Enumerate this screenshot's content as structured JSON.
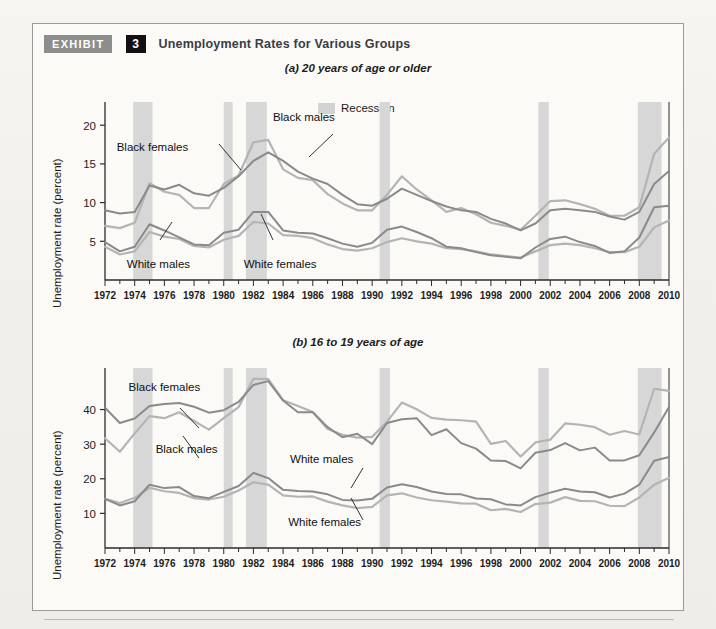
{
  "exhibit": {
    "tag": "EXHIBIT",
    "number": "3",
    "title": "Unemployment Rates for Various Groups"
  },
  "legend": {
    "recession_label": "Recession",
    "recession_color": "#d3d3d3"
  },
  "colors": {
    "black_females": "#8a8a8a",
    "black_males": "#b4b4b4",
    "white_males": "#8a8a8a",
    "white_females": "#b4b4b4",
    "axis": "#2b2b2b",
    "recession_band": "#d7d7d7"
  },
  "chart_data": [
    {
      "type": "line",
      "id": "panel-a",
      "title": "(a) 20 years of age or older",
      "xlabel": "",
      "ylabel": "Unemployment rate (percent)",
      "xlim": [
        1972,
        2010
      ],
      "ylim": [
        0,
        23
      ],
      "yticks": [
        5,
        10,
        15,
        20
      ],
      "grid": false,
      "legend_position": "top-center",
      "x": [
        1972,
        1973,
        1974,
        1975,
        1976,
        1977,
        1978,
        1979,
        1980,
        1981,
        1982,
        1983,
        1984,
        1985,
        1986,
        1987,
        1988,
        1989,
        1990,
        1991,
        1992,
        1993,
        1994,
        1995,
        1996,
        1997,
        1998,
        1999,
        2000,
        2001,
        2002,
        2003,
        2004,
        2005,
        2006,
        2007,
        2008,
        2009,
        2010
      ],
      "recession_bands": [
        [
          1973.9,
          1975.2
        ],
        [
          1980.0,
          1980.6
        ],
        [
          1981.5,
          1982.9
        ],
        [
          1990.5,
          1991.2
        ],
        [
          2001.2,
          2001.9
        ],
        [
          2007.9,
          2009.5
        ]
      ],
      "series": [
        {
          "name": "Black females",
          "values": [
            9.0,
            8.6,
            8.8,
            12.2,
            11.7,
            12.3,
            11.2,
            10.9,
            11.9,
            13.4,
            15.4,
            16.5,
            15.4,
            14.0,
            13.1,
            12.4,
            11.0,
            9.8,
            9.6,
            10.5,
            11.8,
            11.0,
            10.2,
            9.5,
            9.0,
            8.8,
            7.9,
            7.3,
            6.4,
            7.3,
            9.0,
            9.2,
            9.0,
            8.8,
            8.2,
            7.8,
            8.8,
            12.4,
            14.1
          ]
        },
        {
          "name": "Black males",
          "values": [
            7.0,
            6.7,
            7.4,
            12.5,
            11.4,
            11.0,
            9.3,
            9.3,
            12.4,
            13.5,
            17.8,
            18.1,
            14.3,
            13.2,
            12.9,
            11.1,
            9.9,
            9.0,
            9.0,
            11.0,
            13.4,
            11.7,
            10.3,
            8.8,
            9.3,
            8.5,
            7.4,
            7.0,
            6.5,
            8.3,
            10.2,
            10.3,
            9.8,
            9.2,
            8.3,
            8.3,
            9.4,
            16.3,
            18.4
          ]
        },
        {
          "name": "White males",
          "values": [
            4.9,
            3.7,
            4.3,
            7.2,
            6.4,
            5.5,
            4.6,
            4.5,
            6.1,
            6.5,
            8.8,
            8.8,
            6.4,
            6.1,
            6.0,
            5.4,
            4.7,
            4.3,
            4.8,
            6.5,
            6.9,
            6.2,
            5.4,
            4.3,
            4.1,
            3.6,
            3.2,
            3.0,
            2.8,
            4.2,
            5.3,
            5.6,
            4.9,
            4.4,
            3.5,
            3.7,
            5.5,
            9.4,
            9.6
          ]
        },
        {
          "name": "White females",
          "values": [
            4.3,
            3.3,
            3.7,
            6.2,
            5.6,
            5.3,
            4.4,
            4.2,
            5.2,
            5.7,
            7.5,
            7.3,
            5.8,
            5.7,
            5.4,
            4.6,
            4.0,
            3.8,
            4.1,
            4.9,
            5.4,
            5.0,
            4.7,
            4.1,
            4.0,
            3.7,
            3.3,
            3.1,
            2.9,
            3.7,
            4.5,
            4.7,
            4.5,
            4.1,
            3.6,
            3.6,
            4.3,
            6.8,
            7.7
          ]
        }
      ],
      "annotations": [
        {
          "text": "Black females",
          "x": 1975.2,
          "y": 16.7
        },
        {
          "text": "Black males",
          "x": 1985.4,
          "y": 20.6
        },
        {
          "text": "White males",
          "x": 1975.6,
          "y": 1.6
        },
        {
          "text": "White females",
          "x": 1983.8,
          "y": 1.6
        }
      ]
    },
    {
      "type": "line",
      "id": "panel-b",
      "title": "(b) 16 to 19 years of age",
      "xlabel": "",
      "ylabel": "Unemployment rate (percent)",
      "xlim": [
        1972,
        2010
      ],
      "ylim": [
        0,
        52
      ],
      "yticks": [
        10,
        20,
        30,
        40
      ],
      "grid": false,
      "legend_position": "none",
      "x": [
        1972,
        1973,
        1974,
        1975,
        1976,
        1977,
        1978,
        1979,
        1980,
        1981,
        1982,
        1983,
        1984,
        1985,
        1986,
        1987,
        1988,
        1989,
        1990,
        1991,
        1992,
        1993,
        1994,
        1995,
        1996,
        1997,
        1998,
        1999,
        2000,
        2001,
        2002,
        2003,
        2004,
        2005,
        2006,
        2007,
        2008,
        2009,
        2010
      ],
      "recession_bands": [
        [
          1973.9,
          1975.2
        ],
        [
          1980.0,
          1980.6
        ],
        [
          1981.5,
          1982.9
        ],
        [
          1990.5,
          1991.2
        ],
        [
          2001.2,
          2001.9
        ],
        [
          2007.9,
          2009.5
        ]
      ],
      "series": [
        {
          "name": "Black females",
          "values": [
            40.5,
            36.1,
            37.4,
            41.0,
            41.6,
            41.9,
            40.8,
            39.1,
            39.8,
            42.2,
            47.1,
            48.2,
            42.6,
            39.2,
            39.2,
            34.9,
            32.0,
            33.0,
            30.0,
            36.1,
            37.2,
            37.5,
            32.6,
            34.3,
            30.3,
            28.7,
            25.3,
            25.1,
            23.0,
            27.5,
            28.3,
            30.3,
            28.2,
            29.0,
            25.3,
            25.3,
            26.8,
            33.4,
            40.7
          ]
        },
        {
          "name": "Black males",
          "values": [
            31.7,
            27.8,
            33.1,
            38.1,
            37.5,
            39.2,
            36.7,
            34.2,
            37.5,
            40.7,
            48.9,
            48.8,
            42.7,
            41.0,
            39.3,
            34.4,
            32.7,
            31.9,
            32.1,
            36.5,
            42.0,
            40.1,
            37.6,
            37.1,
            36.9,
            36.5,
            30.1,
            30.9,
            26.4,
            30.5,
            31.3,
            36.0,
            35.6,
            34.9,
            32.7,
            33.8,
            32.8,
            46.0,
            45.4
          ]
        },
        {
          "name": "White males",
          "values": [
            14.2,
            12.3,
            13.5,
            18.3,
            17.3,
            17.6,
            15.0,
            14.4,
            16.2,
            17.9,
            21.7,
            20.2,
            16.8,
            16.5,
            16.3,
            15.5,
            13.9,
            13.7,
            14.2,
            17.5,
            18.4,
            17.6,
            16.3,
            15.6,
            15.5,
            14.3,
            14.1,
            12.6,
            12.3,
            14.7,
            16.0,
            17.1,
            16.3,
            16.1,
            14.6,
            15.7,
            18.3,
            25.2,
            26.3
          ]
        },
        {
          "name": "White females",
          "values": [
            14.2,
            13.0,
            14.5,
            17.4,
            16.4,
            15.9,
            14.4,
            14.0,
            14.8,
            16.6,
            19.0,
            18.3,
            15.2,
            14.8,
            14.9,
            13.4,
            12.3,
            11.5,
            11.9,
            15.2,
            15.8,
            14.6,
            13.8,
            13.4,
            12.9,
            12.8,
            10.9,
            11.3,
            10.4,
            12.7,
            13.1,
            14.7,
            13.6,
            13.5,
            12.2,
            12.1,
            14.6,
            18.3,
            20.3
          ]
        }
      ],
      "annotations": [
        {
          "text": "Black females",
          "x": 1976.0,
          "y": 45.3
        },
        {
          "text": "Black males",
          "x": 1977.5,
          "y": 27.5
        },
        {
          "text": "White males",
          "x": 1986.6,
          "y": 24.6
        },
        {
          "text": "White females",
          "x": 1986.8,
          "y": 6.3
        }
      ]
    }
  ],
  "xticks": [
    1972,
    1974,
    1976,
    1978,
    1980,
    1982,
    1984,
    1986,
    1988,
    1990,
    1992,
    1994,
    1996,
    1998,
    2000,
    2002,
    2004,
    2006,
    2008,
    2010
  ]
}
